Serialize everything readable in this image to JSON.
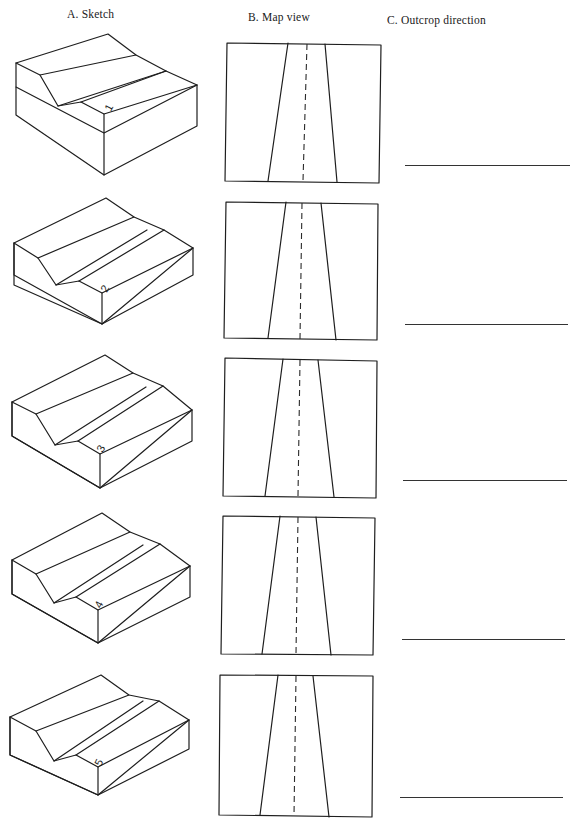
{
  "headers": {
    "sketch": "A. Sketch",
    "map_view": "B. Map view",
    "outcrop_direction": "C. Outcrop direction"
  },
  "rows": [
    {
      "number": "1",
      "top": 35,
      "answer": ""
    },
    {
      "number": "2",
      "top": 193,
      "answer": ""
    },
    {
      "number": "3",
      "top": 350,
      "answer": ""
    },
    {
      "number": "4",
      "top": 508,
      "answer": ""
    },
    {
      "number": "5",
      "top": 665,
      "answer": ""
    }
  ],
  "map_view": {
    "description": "Two inclined contact lines converging toward the top with a dashed centerline (valley axis)"
  },
  "colors": {
    "line": "#1e1e1e",
    "background": "#ffffff"
  }
}
